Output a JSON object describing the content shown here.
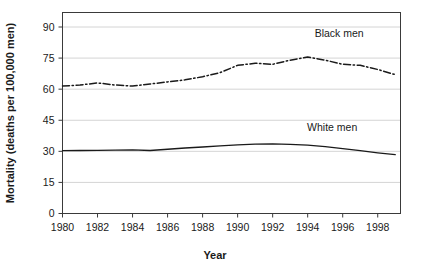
{
  "chart_data": {
    "type": "line",
    "title": "",
    "xlabel": "Year",
    "ylabel": "Mortality (deaths per 100,000 men)",
    "xlim": [
      1980,
      1999.3
    ],
    "ylim": [
      0,
      97
    ],
    "grid": "horizontal",
    "legend_position": "inline-annotations",
    "x_ticks": [
      "1980",
      "1982",
      "1984",
      "1986",
      "1988",
      "1990",
      "1992",
      "1994",
      "1996",
      "1998"
    ],
    "x_tick_values": [
      1980,
      1982,
      1984,
      1986,
      1988,
      1990,
      1992,
      1994,
      1996,
      1998
    ],
    "y_ticks": [
      "0",
      "15",
      "30",
      "45",
      "60",
      "75",
      "90"
    ],
    "y_tick_values": [
      0,
      15,
      30,
      45,
      60,
      75,
      90
    ],
    "x": [
      1980,
      1981,
      1982,
      1983,
      1984,
      1985,
      1986,
      1987,
      1988,
      1989,
      1990,
      1991,
      1992,
      1993,
      1994,
      1995,
      1996,
      1997,
      1998,
      1999
    ],
    "series": [
      {
        "name": "Black men",
        "style": "dash-dot",
        "color": "#1a1a1a",
        "values": [
          61.5,
          62.0,
          63.0,
          62.0,
          61.5,
          62.5,
          63.5,
          64.5,
          66.0,
          68.0,
          71.5,
          72.5,
          72.0,
          74.0,
          75.5,
          74.0,
          72.0,
          71.5,
          69.5,
          67.0
        ]
      },
      {
        "name": "White men",
        "style": "solid",
        "color": "#1a1a1a",
        "values": [
          30.3,
          30.4,
          30.5,
          30.6,
          30.7,
          30.4,
          31.0,
          31.6,
          32.1,
          32.6,
          33.1,
          33.5,
          33.6,
          33.4,
          33.0,
          32.3,
          31.3,
          30.3,
          29.3,
          28.4
        ]
      }
    ],
    "annotations": [
      {
        "text": "Black men",
        "x": 1995.8,
        "y": 85.0
      },
      {
        "text": "White men",
        "x": 1995.4,
        "y": 40.0
      }
    ]
  }
}
